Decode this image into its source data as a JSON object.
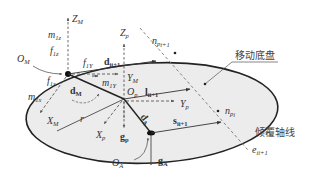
{
  "diagram": {
    "type": "mobile-chassis-tipover-force-diagram",
    "labels": {
      "chassis": "移动底盘",
      "tipover_axis": "倾覆轴线"
    },
    "points": {
      "O_M": {
        "base": "O",
        "sub": "M"
      },
      "O_p": {
        "base": "O",
        "sub": "p"
      },
      "O_A": {
        "base": "O",
        "sub": "A"
      }
    },
    "axes": {
      "Z_M": {
        "base": "Z",
        "sub": "M"
      },
      "Y_M": {
        "base": "Y",
        "sub": "M"
      },
      "X_M": {
        "base": "X",
        "sub": "M"
      },
      "Z_p": {
        "base": "Z",
        "sub": "p"
      },
      "Y_p": {
        "base": "Y",
        "sub": "p"
      },
      "X_p": {
        "base": "X",
        "sub": "p"
      }
    },
    "forces": {
      "f_1z": {
        "base": "f",
        "sub": "1z"
      },
      "f_1Y": {
        "base": "f",
        "sub": "1Y"
      },
      "f_1x": {
        "base": "f",
        "sub": "1x"
      }
    },
    "moments": {
      "m_1z": {
        "base": "m",
        "sub": "1z"
      },
      "m_1Y": {
        "base": "m",
        "sub": "1Y"
      },
      "m_1x": {
        "base": "m",
        "sub": "1x"
      }
    },
    "vectors": {
      "d_ii1": {
        "base": "d",
        "sub": "ii+1"
      },
      "l_ii1": {
        "base": "l",
        "sub": "ii+1"
      },
      "s_ii1": {
        "base": "s",
        "sub": "ii+1"
      },
      "d_M": {
        "base": "d",
        "sub": "M"
      },
      "d_A": {
        "base": "d",
        "sub": "A"
      },
      "g_p": {
        "base": "g",
        "sub": "p"
      },
      "g_A": {
        "base": "g",
        "sub": "A"
      }
    },
    "normals": {
      "n_pi1": {
        "base": "n",
        "sub": "p",
        "subsub": "i+1"
      },
      "n_pi": {
        "base": "n",
        "sub": "p",
        "subsub": "i"
      }
    },
    "edge": {
      "e_ii1": {
        "base": "e",
        "sub": "ii+1"
      }
    },
    "scalars": {
      "r": "r"
    },
    "colors": {
      "ellipse_fill": "#ececec",
      "stroke": "#222222",
      "dashed": "#666666"
    }
  }
}
